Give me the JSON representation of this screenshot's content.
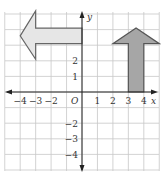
{
  "diagram": {
    "type": "coordinate-grid",
    "axes": {
      "x_label": "x",
      "y_label": "y",
      "origin_label": "O",
      "x_ticks": [
        {
          "value": -4,
          "label": "−4"
        },
        {
          "value": -3,
          "label": "−3"
        },
        {
          "value": -2,
          "label": "−2"
        },
        {
          "value": 1,
          "label": "1"
        },
        {
          "value": 2,
          "label": "2"
        },
        {
          "value": 3,
          "label": "3"
        },
        {
          "value": 4,
          "label": "4"
        }
      ],
      "y_ticks": [
        {
          "value": 2,
          "label": "2"
        },
        {
          "value": 1,
          "label": "1"
        },
        {
          "value": -2,
          "label": "−2"
        },
        {
          "value": -3,
          "label": "−3"
        },
        {
          "value": -4,
          "label": "−4"
        }
      ]
    },
    "shapes": [
      {
        "name": "left-arrow",
        "fill": "#e6e6e6",
        "stroke": "#666666",
        "direction": "left",
        "points": [
          [
            -4,
            3.6
          ],
          [
            -3,
            5.2
          ],
          [
            -3,
            4.1
          ],
          [
            0,
            4.1
          ],
          [
            0,
            3.1
          ],
          [
            -3,
            3.1
          ],
          [
            -3,
            2.1
          ]
        ]
      },
      {
        "name": "up-arrow",
        "fill": "#a6a6a6",
        "stroke": "#555555",
        "direction": "up",
        "points": [
          [
            3.5,
            4.1
          ],
          [
            5,
            3.1
          ],
          [
            4,
            3.1
          ],
          [
            4,
            0
          ],
          [
            3,
            0
          ],
          [
            3,
            3.1
          ],
          [
            2,
            3.1
          ]
        ]
      }
    ],
    "colors": {
      "grid": "#c8c8c8",
      "axis": "#222222"
    }
  }
}
